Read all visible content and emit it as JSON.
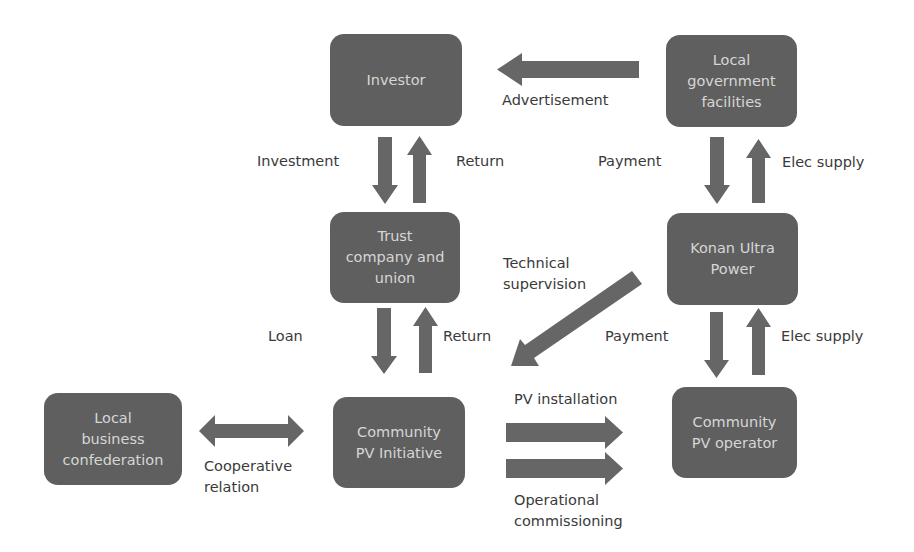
{
  "colors": {
    "node_fill": "#5f5f5f",
    "node_text": "#d6d6d6",
    "arrow": "#666666",
    "label_text": "#3a3a3a",
    "background": "#ffffff"
  },
  "nodes": {
    "investor": "Investor",
    "local_gov": "Local\ngovernment\nfacilities",
    "trust": "Trust\ncompany and\nunion",
    "konan": "Konan Ultra\nPower",
    "local_business": "Local\nbusiness\nconfederation",
    "community_init": "Community\nPV Initiative",
    "community_op": "Community\nPV operator"
  },
  "labels": {
    "advertisement": "Advertisement",
    "investment": "Investment",
    "return_top": "Return",
    "payment_top": "Payment",
    "elec_supply_top": "Elec supply",
    "technical_supervision": "Technical\nsupervision",
    "loan": "Loan",
    "return_bottom": "Return",
    "payment_bottom": "Payment",
    "elec_supply_bottom": "Elec supply",
    "pv_installation": "PV installation",
    "cooperative_relation": "Cooperative\nrelation",
    "operational_commissioning": "Operational\ncommissioning"
  },
  "edges": [
    {
      "from": "local_gov",
      "to": "investor",
      "label": "Advertisement"
    },
    {
      "from": "investor",
      "to": "trust",
      "label": "Investment"
    },
    {
      "from": "trust",
      "to": "investor",
      "label": "Return"
    },
    {
      "from": "local_gov",
      "to": "konan",
      "label": "Payment"
    },
    {
      "from": "konan",
      "to": "local_gov",
      "label": "Elec supply"
    },
    {
      "from": "konan",
      "to": "community_init",
      "label": "Technical supervision"
    },
    {
      "from": "trust",
      "to": "community_init",
      "label": "Loan"
    },
    {
      "from": "community_init",
      "to": "trust",
      "label": "Return"
    },
    {
      "from": "konan",
      "to": "community_op",
      "label": "Payment"
    },
    {
      "from": "community_op",
      "to": "konan",
      "label": "Elec supply"
    },
    {
      "from": "local_business",
      "to": "community_init",
      "label": "Cooperative relation",
      "bidirectional": true
    },
    {
      "from": "community_init",
      "to": "community_op",
      "label": "PV installation"
    },
    {
      "from": "community_init",
      "to": "community_op",
      "label": "Operational commissioning"
    }
  ]
}
